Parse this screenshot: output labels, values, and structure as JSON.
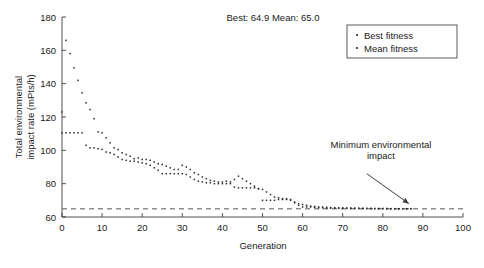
{
  "chart_data": {
    "type": "scatter",
    "title": "Best: 64.9 Mean: 65.0",
    "xlabel": "Generation",
    "ylabel_line1": "Total environmental",
    "ylabel_line2": "impact rate (mPts/h)",
    "xlim": [
      0,
      100
    ],
    "ylim": [
      60,
      180
    ],
    "xticks": [
      0,
      10,
      20,
      30,
      40,
      50,
      60,
      70,
      80,
      90,
      100
    ],
    "yticks": [
      60,
      80,
      100,
      120,
      140,
      160,
      180
    ],
    "grid": false,
    "legend_position": "top-right",
    "marker": "dot",
    "marker_color": "#2b2b2b",
    "reference_line": {
      "label": "minimum-environmental-impact-line",
      "y": 64.9,
      "style": "dashed",
      "x_start": 0,
      "x_end": 100
    },
    "annotations": [
      {
        "text_line1": "Minimum environmental",
        "text_line2": "impact",
        "arrow_from_x": 76,
        "arrow_from_y": 86,
        "arrow_to_x": 86.5,
        "arrow_to_y": 68
      }
    ],
    "series": [
      {
        "name": "Best fitness",
        "x": [
          0,
          1,
          2,
          3,
          4,
          5,
          6,
          7,
          8,
          9,
          10,
          11,
          12,
          13,
          14,
          15,
          16,
          17,
          18,
          19,
          20,
          21,
          22,
          23,
          24,
          25,
          26,
          27,
          28,
          29,
          30,
          31,
          32,
          33,
          34,
          35,
          36,
          37,
          38,
          39,
          40,
          41,
          42,
          43,
          44,
          45,
          46,
          47,
          48,
          49,
          50,
          51,
          52,
          53,
          54,
          55,
          56,
          57,
          58,
          59,
          60,
          61,
          62,
          63,
          64,
          65,
          66,
          67,
          68,
          69,
          70,
          71,
          72,
          73,
          74,
          75,
          76,
          77,
          78,
          79,
          80,
          81,
          82,
          83,
          84,
          85,
          86,
          87
        ],
        "y": [
          110.5,
          110.5,
          110.5,
          110.5,
          110.5,
          110.5,
          103.0,
          101.5,
          101.5,
          101.0,
          100.5,
          99.0,
          98.5,
          97.5,
          96.0,
          94.5,
          94.0,
          93.5,
          93.5,
          93.0,
          92.5,
          92.0,
          91.0,
          89.5,
          88.0,
          86.0,
          86.0,
          86.0,
          86.0,
          86.0,
          86.0,
          85.5,
          84.0,
          82.5,
          81.5,
          81.0,
          80.5,
          80.5,
          80.0,
          80.0,
          80.0,
          80.0,
          80.0,
          78.0,
          77.5,
          77.5,
          77.5,
          77.5,
          77.5,
          77.0,
          70.0,
          70.0,
          70.0,
          70.0,
          70.5,
          70.5,
          70.5,
          70.0,
          69.0,
          67.0,
          66.0,
          66.0,
          66.0,
          65.8,
          65.5,
          65.5,
          65.4,
          65.3,
          65.3,
          65.2,
          65.2,
          65.2,
          65.1,
          65.1,
          65.1,
          65.1,
          65.0,
          65.0,
          65.0,
          65.0,
          65.0,
          65.0,
          64.9,
          64.9,
          64.9,
          64.9,
          64.9,
          64.9
        ]
      },
      {
        "name": "Mean fitness",
        "x": [
          0,
          1,
          2,
          3,
          4,
          5,
          6,
          7,
          8,
          9,
          10,
          11,
          12,
          13,
          14,
          15,
          16,
          17,
          18,
          19,
          20,
          21,
          22,
          23,
          24,
          25,
          26,
          27,
          28,
          29,
          30,
          31,
          32,
          33,
          34,
          35,
          36,
          37,
          38,
          39,
          40,
          41,
          42,
          43,
          44,
          45,
          46,
          47,
          48,
          49,
          50,
          51,
          52,
          53,
          54,
          55,
          56,
          57,
          58,
          59,
          60,
          61,
          62,
          63,
          64,
          65,
          66,
          67,
          68,
          69,
          70,
          71,
          72,
          73,
          74,
          75,
          76,
          77,
          78,
          79,
          80,
          81,
          82,
          83,
          84,
          85,
          86,
          87
        ],
        "y": [
          123.0,
          166.0,
          158.0,
          149.5,
          142.0,
          134.5,
          128.5,
          124.5,
          119.0,
          111.0,
          110.5,
          107.5,
          104.5,
          101.5,
          100.5,
          98.5,
          97.5,
          96.5,
          95.0,
          95.5,
          94.5,
          94.5,
          94.0,
          93.0,
          92.0,
          91.5,
          90.5,
          89.5,
          88.5,
          88.5,
          91.0,
          90.0,
          88.5,
          86.5,
          85.5,
          84.0,
          83.0,
          82.0,
          81.5,
          81.0,
          81.0,
          81.5,
          81.0,
          82.5,
          84.5,
          83.0,
          81.5,
          80.0,
          78.5,
          77.0,
          76.5,
          75.0,
          73.5,
          72.0,
          71.5,
          71.0,
          71.0,
          70.5,
          68.5,
          68.0,
          67.5,
          67.0,
          66.5,
          66.3,
          66.0,
          66.0,
          65.8,
          65.7,
          65.6,
          65.5,
          65.5,
          65.4,
          65.4,
          65.3,
          65.3,
          65.2,
          65.2,
          65.2,
          65.1,
          65.1,
          65.1,
          65.1,
          65.0,
          65.0,
          65.0,
          65.0,
          65.0,
          65.0
        ]
      }
    ]
  },
  "legend": {
    "items": [
      {
        "label": "Best fitness"
      },
      {
        "label": "Mean fitness"
      }
    ]
  }
}
